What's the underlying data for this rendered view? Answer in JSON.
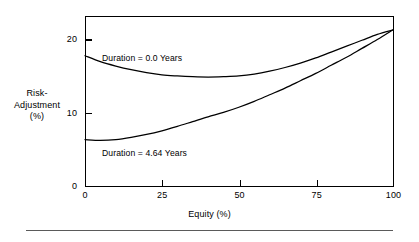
{
  "chart_data": {
    "type": "line",
    "title": "",
    "xlabel": "Equity (%)",
    "ylabel": "Risk-Adjustment (%)",
    "ylabel_lines": [
      "Risk-",
      "Adjustment",
      "(%)"
    ],
    "xlim": [
      0,
      100
    ],
    "ylim": [
      0,
      23.1
    ],
    "grid": false,
    "legend": "inline-annotations",
    "xticks": [
      0,
      25,
      50,
      75,
      100
    ],
    "xtick_labels": [
      "0",
      "25",
      "50",
      "75",
      "100"
    ],
    "yticks": [
      0,
      10,
      20
    ],
    "ytick_labels": [
      "0",
      "10",
      "20"
    ],
    "x": [
      0,
      5,
      10,
      15,
      20,
      25,
      30,
      35,
      40,
      45,
      50,
      55,
      60,
      65,
      70,
      75,
      80,
      85,
      90,
      95,
      100
    ],
    "series": [
      {
        "name": "Duration = 0.0 Years",
        "label": "Duration = 0.0 Years",
        "values": [
          17.7,
          16.9,
          16.3,
          15.8,
          15.4,
          15.1,
          14.95,
          14.85,
          14.8,
          14.85,
          14.95,
          15.2,
          15.6,
          16.1,
          16.7,
          17.4,
          18.2,
          19.0,
          19.8,
          20.6,
          21.2
        ]
      },
      {
        "name": "Duration = 4.64 Years",
        "label": "Duration = 4.64 Years",
        "values": [
          6.3,
          6.2,
          6.3,
          6.6,
          7.0,
          7.5,
          8.1,
          8.75,
          9.4,
          10.0,
          10.7,
          11.5,
          12.4,
          13.3,
          14.3,
          15.3,
          16.4,
          17.5,
          18.7,
          19.9,
          21.2
        ]
      }
    ],
    "annotations": [
      {
        "text": "Duration = 0.0 Years",
        "x": 5.5,
        "y": 18.6
      },
      {
        "text": "Duration = 4.64 Years",
        "x": 5.5,
        "y": 5.2
      }
    ]
  },
  "axes": {
    "y_title_line1": "Risk-",
    "y_title_line2": "Adjustment",
    "y_title_line3": "(%)",
    "x_title": "Equity (%)"
  },
  "colors": {
    "curve": "#000000",
    "axis": "#000000",
    "background": "#ffffff",
    "rule": "#5a5a5a"
  }
}
